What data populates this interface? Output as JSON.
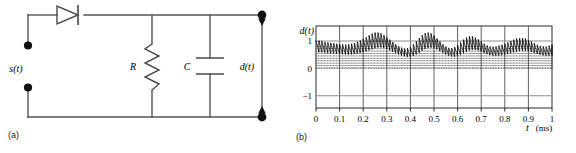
{
  "figure": {
    "panel_a": {
      "caption": "(a)",
      "labels": {
        "input": "s(t)",
        "resistor": "R",
        "capacitor": "C",
        "output": "d(t)"
      },
      "components": [
        "diode",
        "resistor",
        "capacitor",
        "input-terminals",
        "output-terminals"
      ]
    },
    "panel_b": {
      "caption": "(b)",
      "axis": {
        "ylabel": "d(t)",
        "xlabel_var": "t",
        "xlabel_unit": "(ms)",
        "yticks": [
          "1",
          "0",
          "-1"
        ],
        "xticks": [
          "0",
          "0.1",
          "0.2",
          "0.3",
          "0.4",
          "0.5",
          "0.6",
          "0.7",
          "0.8",
          "0.9",
          "1"
        ]
      }
    }
  },
  "chart_data": {
    "type": "line",
    "title": "",
    "xlabel": "t (ms)",
    "ylabel": "d(t)",
    "xlim": [
      0,
      1
    ],
    "ylim": [
      -1.45,
      1.55
    ],
    "yticks": [
      1,
      0,
      -1
    ],
    "xticks": [
      0,
      0.1,
      0.2,
      0.3,
      0.4,
      0.5,
      0.6,
      0.7,
      0.8,
      0.9,
      1
    ],
    "grid": true,
    "legend": null,
    "carrier_period_ms": 0.025,
    "envelope_sample_step_ms": 0.0125,
    "envelope": {
      "x": [
        0.0,
        0.0125,
        0.025,
        0.0375,
        0.05,
        0.0625,
        0.075,
        0.0875,
        0.1,
        0.1125,
        0.125,
        0.1375,
        0.15,
        0.1625,
        0.175,
        0.1875,
        0.2,
        0.2125,
        0.225,
        0.2375,
        0.25,
        0.2625,
        0.275,
        0.2875,
        0.3,
        0.3125,
        0.325,
        0.3375,
        0.35,
        0.3625,
        0.375,
        0.3875,
        0.4,
        0.4125,
        0.425,
        0.4375,
        0.45,
        0.4625,
        0.475,
        0.4875,
        0.5,
        0.5125,
        0.525,
        0.5375,
        0.55,
        0.5625,
        0.575,
        0.5875,
        0.6,
        0.6125,
        0.625,
        0.6375,
        0.65,
        0.6625,
        0.675,
        0.6875,
        0.7,
        0.7125,
        0.725,
        0.7375,
        0.75,
        0.7625,
        0.775,
        0.7875,
        0.8,
        0.8125,
        0.825,
        0.8375,
        0.85,
        0.8625,
        0.875,
        0.8875,
        0.9,
        0.9125,
        0.925,
        0.9375,
        0.95,
        0.9625,
        0.975,
        0.9875,
        1.0
      ],
      "y": [
        1.02,
        1.01,
        0.99,
        0.96,
        0.95,
        0.93,
        0.92,
        0.9,
        0.89,
        0.88,
        0.87,
        0.88,
        0.9,
        0.93,
        0.97,
        1.02,
        1.08,
        1.14,
        1.21,
        1.27,
        1.31,
        1.31,
        1.28,
        1.22,
        1.14,
        1.05,
        0.96,
        0.88,
        0.81,
        0.76,
        0.73,
        0.74,
        0.79,
        0.88,
        0.99,
        1.11,
        1.22,
        1.29,
        1.31,
        1.28,
        1.2,
        1.09,
        0.98,
        0.88,
        0.8,
        0.75,
        0.74,
        0.78,
        0.85,
        0.95,
        1.05,
        1.13,
        1.17,
        1.17,
        1.13,
        1.06,
        0.98,
        0.9,
        0.84,
        0.8,
        0.79,
        0.8,
        0.83,
        0.86,
        0.9,
        0.95,
        1.0,
        1.05,
        1.09,
        1.11,
        1.11,
        1.09,
        1.04,
        0.98,
        0.92,
        0.86,
        0.82,
        0.8,
        0.8,
        0.83,
        0.87
      ]
    },
    "ripple": {
      "decay_fraction": 0.42,
      "note": "each carrier cycle: instant rise to envelope peak then exponential decay to ~0.58 of peak"
    }
  }
}
